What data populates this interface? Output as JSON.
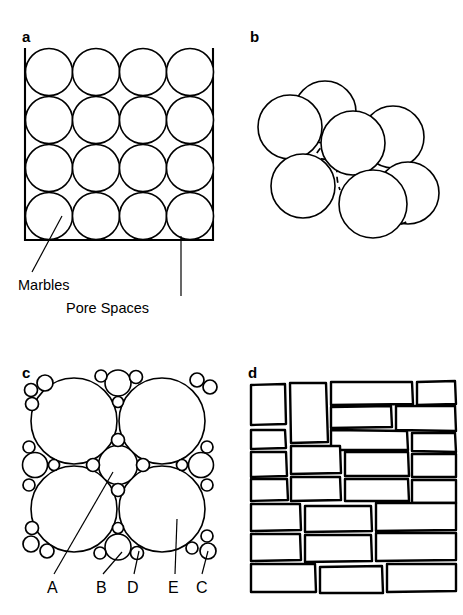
{
  "figure": {
    "background_color": "#ffffff",
    "ink_color": "#000000",
    "width": 463,
    "height": 615
  },
  "panels": [
    {
      "id": "a",
      "letter": "a",
      "letter_x": 22,
      "letter_y": 42,
      "description": "Square container filled with a 4 by 4 grid of equal-sized marbles",
      "frame": {
        "x": 25,
        "y": 48,
        "width": 188,
        "height": 192
      },
      "grid": {
        "rows": 4,
        "cols": 4,
        "radius": 23.5
      },
      "callouts": [
        {
          "name": "marbles",
          "label": "Marbles",
          "label_x": 18,
          "label_y": 290,
          "leader": {
            "x1": 62,
            "y1": 216,
            "x2": 32,
            "y2": 272
          }
        },
        {
          "name": "pore-spaces",
          "label": "Pore Spaces",
          "label_x": 66,
          "label_y": 313,
          "leader": {
            "x1": 181,
            "y1": 236,
            "x2": 181,
            "y2": 296
          }
        }
      ]
    },
    {
      "id": "b",
      "letter": "b",
      "letter_x": 250,
      "letter_y": 42,
      "description": "Three-dimensional cluster of seven overlapping spheres with dashed hidden edges"
    },
    {
      "id": "c",
      "letter": "c",
      "letter_x": 22,
      "letter_y": 378,
      "description": "Four large packed spheres with a medium sphere at the centre and many small spheres filling the interstitial pore spaces",
      "point_labels": [
        {
          "key": "A",
          "label": "A",
          "label_x": 47,
          "label_y": 593,
          "leader": {
            "x1": 113,
            "y1": 472,
            "x2": 54,
            "y2": 574
          }
        },
        {
          "key": "B",
          "label": "B",
          "label_x": 96,
          "label_y": 593,
          "leader": {
            "x1": 122,
            "y1": 552,
            "x2": 103,
            "y2": 574
          }
        },
        {
          "key": "D",
          "label": "D",
          "label_x": 127,
          "label_y": 593,
          "leader": {
            "x1": 139,
            "y1": 551,
            "x2": 134,
            "y2": 574
          }
        },
        {
          "key": "E",
          "label": "E",
          "label_x": 168,
          "label_y": 593,
          "leader": {
            "x1": 177,
            "y1": 519,
            "x2": 175,
            "y2": 574
          }
        },
        {
          "key": "C",
          "label": "C",
          "label_x": 196,
          "label_y": 593,
          "leader": {
            "x1": 208,
            "y1": 551,
            "x2": 202,
            "y2": 574
          }
        }
      ]
    },
    {
      "id": "d",
      "letter": "d",
      "letter_x": 248,
      "letter_y": 378,
      "description": "Irregular hand-drawn masonry brick wall pattern representing cemented, low-porosity rock"
    }
  ]
}
